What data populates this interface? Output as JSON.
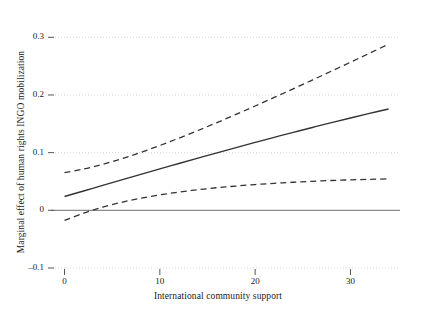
{
  "chart_data": {
    "type": "line",
    "title": "",
    "subtitle": "",
    "xlabel": "International community support",
    "ylabel": "Marginal effect of human rights INGO mobilization",
    "xlim": [
      -1.0,
      35.2
    ],
    "ylim": [
      -0.1,
      0.33
    ],
    "xticks": [
      0,
      10,
      20,
      30
    ],
    "xtick_labels": [
      "0",
      "10",
      "20",
      "30"
    ],
    "yticks": [
      -0.1,
      0,
      0.1,
      0.2,
      0.3
    ],
    "ytick_labels": [
      "–0.1",
      "0",
      "0.1",
      "0.2",
      "0.3"
    ],
    "grid": true,
    "grid_axis": "y",
    "legend": "none",
    "zero_line": 0,
    "x": [
      0,
      2,
      4,
      6,
      8,
      10,
      12,
      14,
      16,
      18,
      20,
      22,
      24,
      26,
      28,
      30,
      32,
      34
    ],
    "series": [
      {
        "name": "Marginal effect",
        "style": "solid",
        "color": "#333333",
        "values": [
          0.024,
          0.0335,
          0.0432,
          0.0528,
          0.0623,
          0.0718,
          0.0812,
          0.0905,
          0.0997,
          0.1088,
          0.1178,
          0.1266,
          0.1352,
          0.1437,
          0.152,
          0.1601,
          0.168,
          0.1757
        ]
      },
      {
        "name": "Upper 95% confidence bound",
        "style": "dashed",
        "color": "#333333",
        "values": [
          0.0655,
          0.0716,
          0.0797,
          0.0894,
          0.1004,
          0.1124,
          0.1251,
          0.1384,
          0.1522,
          0.1664,
          0.1809,
          0.1957,
          0.2107,
          0.2259,
          0.2413,
          0.2568,
          0.2724,
          0.2881
        ]
      },
      {
        "name": "Lower 95% confidence bound",
        "style": "dashed",
        "color": "#333333",
        "values": [
          -0.0175,
          -0.0049,
          0.0054,
          0.0139,
          0.0209,
          0.0268,
          0.0316,
          0.0357,
          0.0392,
          0.0421,
          0.0447,
          0.0468,
          0.0487,
          0.0503,
          0.0517,
          0.0528,
          0.0538,
          0.0546
        ]
      }
    ],
    "annotations": []
  },
  "style": {
    "background": "#ffffff",
    "grid_color": "#d8d8d8",
    "zero_line_color": "#8c8c8c",
    "line_color": "#333333",
    "tick_color": "#555555",
    "text_color": "#1a1a1a"
  }
}
